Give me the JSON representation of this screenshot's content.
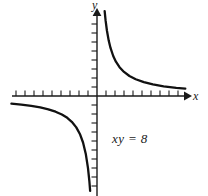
{
  "figure": {
    "name": "hyperbola-graph",
    "background_color": "#ffffff",
    "width": 208,
    "height": 196
  },
  "labels": {
    "y_axis": "y",
    "x_axis": "x",
    "equation": "xy = 8"
  },
  "chart_data": {
    "type": "line",
    "title": "",
    "subtitle": "",
    "xlabel": "x",
    "ylabel": "y",
    "annotations": [
      "xy = 8"
    ],
    "grid": false,
    "legend": false,
    "axis_style": {
      "arrowheads": [
        "x-positive",
        "y-positive"
      ],
      "tick_spacing_units": 1,
      "tick_length_px": 5,
      "origin_px": [
        97,
        96
      ],
      "units_per_px": 0.111
    },
    "xlim": [
      -9.5,
      9.8
    ],
    "ylim": [
      -11.0,
      10.5
    ],
    "equation": "xy = 8",
    "series": [
      {
        "name": "upper-right-branch",
        "comment": "y = 8/x for x > 0",
        "x": [
          0.85,
          0.95,
          1.1,
          1.3,
          1.5,
          1.8,
          2.1,
          2.5,
          3.0,
          3.6,
          4.3,
          5.2,
          6.2,
          7.4,
          8.8,
          9.8
        ],
        "y": [
          9.41,
          8.42,
          7.27,
          6.15,
          5.33,
          4.44,
          3.81,
          3.2,
          2.67,
          2.22,
          1.86,
          1.54,
          1.29,
          1.08,
          0.91,
          0.82
        ]
      },
      {
        "name": "lower-left-branch",
        "comment": "y = 8/x for x < 0",
        "x": [
          -9.5,
          -8.4,
          -7.3,
          -6.3,
          -5.4,
          -4.6,
          -3.9,
          -3.3,
          -2.8,
          -2.3,
          -1.9,
          -1.55,
          -1.25,
          -1.0,
          -0.85,
          -0.76
        ],
        "y": [
          -0.84,
          -0.95,
          -1.1,
          -1.27,
          -1.48,
          -1.74,
          -2.05,
          -2.42,
          -2.86,
          -3.48,
          -4.21,
          -5.16,
          -6.4,
          -8.0,
          -9.41,
          -10.53
        ]
      }
    ]
  }
}
